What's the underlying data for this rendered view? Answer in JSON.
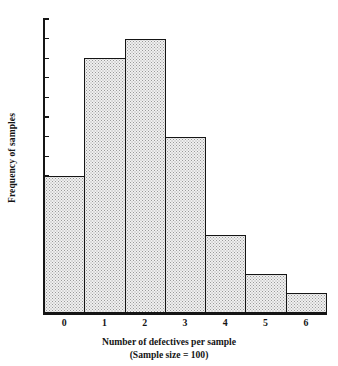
{
  "chart_data": {
    "type": "bar",
    "title": "",
    "subtitle": "",
    "xlabel": "Number of defectives per sample",
    "xlabel_line2": "(Sample size = 100)",
    "ylabel": "Frequency of samples",
    "categories": [
      "0",
      "1",
      "2",
      "3",
      "4",
      "5",
      "6"
    ],
    "values": [
      7,
      13,
      14,
      9,
      4,
      2,
      1
    ],
    "ytick_labels": [
      "15",
      "14",
      "13",
      "12",
      "11",
      "10",
      "9",
      "8",
      "7",
      "6",
      "5",
      "4",
      "3",
      "2",
      "1"
    ],
    "yticks": [
      15,
      14,
      13,
      12,
      11,
      10,
      9,
      8,
      7,
      6,
      5,
      4,
      3,
      2,
      1
    ],
    "ylim": [
      0,
      15
    ],
    "xlim": [
      -0.5,
      6.5
    ],
    "grid": false,
    "legend": false,
    "bar_fill_color": "#f0f0f0",
    "bar_stipple_color": "#9a9a9a",
    "axis_color": "#151515"
  }
}
